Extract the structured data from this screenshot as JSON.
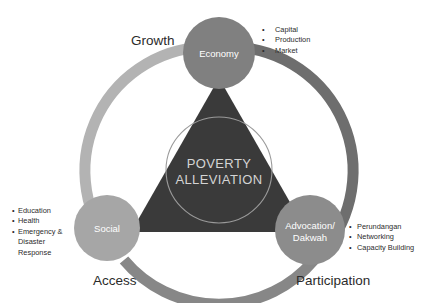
{
  "diagram": {
    "center": {
      "line1": "POVERTY",
      "line2": "ALLEVIATION",
      "text_color": "#d4d4d4",
      "triangle_color": "#3a3a3a"
    },
    "nodes": [
      {
        "id": "economy",
        "label": "Economy",
        "color": "#808080",
        "outer_label": "Growth",
        "bullets": [
          "Capital",
          "Production",
          "Market"
        ]
      },
      {
        "id": "social",
        "label": "Social",
        "color": "#a6a6a6",
        "outer_label": "Access",
        "bullets": [
          "Education",
          "Health",
          "Emergency & Disaster Response"
        ]
      },
      {
        "id": "advocation",
        "label": "Advocation/ Dakwah",
        "label_line1": "Advocation/",
        "label_line2": "Dakwah",
        "color": "#8c8c8c",
        "outer_label": "Participation",
        "bullets": [
          "Perundangan",
          "Networking",
          "Capacity Building"
        ]
      }
    ],
    "arcs": [
      {
        "id": "arc-left",
        "color": "#b3b3b3"
      },
      {
        "id": "arc-right",
        "color": "#6e6e6e"
      },
      {
        "id": "arc-bottom",
        "color": "#878787"
      }
    ],
    "bullet_marker": "•",
    "social_bullet_wrap": [
      "Emergency &",
      "Disaster",
      "Response"
    ]
  }
}
